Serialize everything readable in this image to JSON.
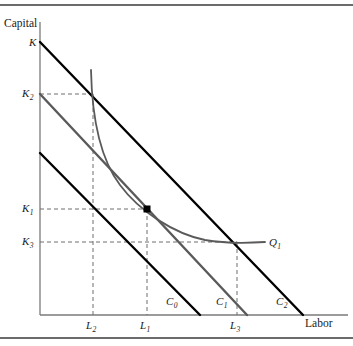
{
  "figure": {
    "type": "economics-isoquant-isocost-diagram",
    "axes": {
      "y_title": "Capital",
      "x_title": "Labor",
      "origin": {
        "x": 40,
        "y": 315
      },
      "y_axis_top": 22,
      "x_axis_right": 348
    },
    "colors": {
      "isocost_black": "#000000",
      "isocost_gray": "#5a5a5a",
      "isoquant": "#5a5a5a",
      "axis": "#7a7a7a",
      "dashed_guide": "#6e6e6e",
      "rule": "#3a3a3a",
      "text": "#1a1a1a"
    },
    "y_axis_labels": [
      {
        "name": "K",
        "text": "K",
        "sub": "",
        "x": 29,
        "y": 37,
        "value_y": 42
      },
      {
        "name": "K2",
        "text": "K",
        "sub": "2",
        "x": 22,
        "y": 88,
        "value_y": 94
      },
      {
        "name": "K1",
        "text": "K",
        "sub": "1",
        "x": 22,
        "y": 203,
        "value_y": 209
      },
      {
        "name": "K3",
        "text": "K",
        "sub": "3",
        "x": 22,
        "y": 236,
        "value_y": 242
      }
    ],
    "x_axis_labels": [
      {
        "name": "L2",
        "text": "L",
        "sub": "2",
        "x": 86,
        "y": 320,
        "value_x": 93
      },
      {
        "name": "L1",
        "text": "L",
        "sub": "1",
        "x": 140,
        "y": 320,
        "value_x": 147
      },
      {
        "name": "L3",
        "text": "L",
        "sub": "3",
        "x": 230,
        "y": 320,
        "value_x": 237
      }
    ],
    "curve_labels": [
      {
        "name": "C0",
        "text": "C",
        "sub": "0",
        "x": 166,
        "y": 296
      },
      {
        "name": "C1",
        "text": "C",
        "sub": "1",
        "x": 216,
        "y": 296
      },
      {
        "name": "C2",
        "text": "C",
        "sub": "2",
        "x": 276,
        "y": 296
      },
      {
        "name": "Q1",
        "text": "Q",
        "sub": "1",
        "x": 269,
        "y": 237
      }
    ],
    "isocost_lines": [
      {
        "name": "C0",
        "from": {
          "x": 40,
          "y": 153
        },
        "to": {
          "x": 200,
          "y": 315
        },
        "color": "#000000",
        "width": 2.4
      },
      {
        "name": "C1",
        "from": {
          "x": 40,
          "y": 94
        },
        "to": {
          "x": 247,
          "y": 315
        },
        "color": "#5a5a5a",
        "width": 2.4
      },
      {
        "name": "C2",
        "from": {
          "x": 40,
          "y": 42
        },
        "to": {
          "x": 303,
          "y": 315
        },
        "color": "#000000",
        "width": 2.4
      }
    ],
    "isoquant": {
      "name": "Q1",
      "points": "M 91,70 C 92,120 101,160 120,185 C 140,212 175,234 205,240 C 228,244 250,243 265,242",
      "color": "#5a5a5a",
      "width": 1.8
    },
    "tangency_point": {
      "name": "optimal-input-combination",
      "x": 147,
      "y": 209,
      "size": 7
    },
    "dashed_guides": [
      {
        "name": "K2-horizontal",
        "x1": 40,
        "y1": 94,
        "x2": 95,
        "y2": 94
      },
      {
        "name": "K1-horizontal",
        "x1": 40,
        "y1": 209,
        "x2": 147,
        "y2": 209
      },
      {
        "name": "K3-horizontal",
        "x1": 40,
        "y1": 242,
        "x2": 237,
        "y2": 242
      },
      {
        "name": "L2-vertical",
        "x1": 93,
        "y1": 94,
        "x2": 93,
        "y2": 315
      },
      {
        "name": "L1-vertical",
        "x1": 147,
        "y1": 209,
        "x2": 147,
        "y2": 315
      },
      {
        "name": "L3-vertical",
        "x1": 237,
        "y1": 242,
        "x2": 237,
        "y2": 315
      }
    ],
    "rules": [
      {
        "name": "top-rule",
        "y": 5,
        "x1": 0,
        "x2": 353
      },
      {
        "name": "bottom-rule",
        "y": 338,
        "x1": 0,
        "x2": 353
      }
    ]
  }
}
